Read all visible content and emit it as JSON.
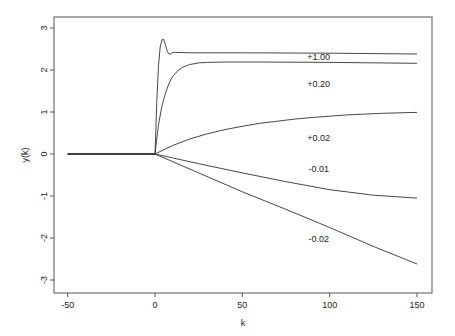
{
  "chart_data": {
    "type": "line",
    "title": "",
    "xlabel": "k",
    "ylabel": "y(k)",
    "xlim": [
      -55,
      160
    ],
    "ylim": [
      -3.2,
      3.3
    ],
    "xticks": [
      -50,
      0,
      50,
      100,
      150
    ],
    "yticks": [
      -3,
      -2,
      -1,
      0,
      1,
      2,
      3
    ],
    "grid": false,
    "legend": "none (inline labels)",
    "line_color": "#333333",
    "series": [
      {
        "name": "+1.00",
        "label_pos": [
          88,
          2.25
        ],
        "points": [
          [
            -50,
            0
          ],
          [
            0,
            0
          ],
          [
            1,
            1.2
          ],
          [
            2,
            2.1
          ],
          [
            3,
            2.55
          ],
          [
            4,
            2.72
          ],
          [
            5,
            2.73
          ],
          [
            6,
            2.6
          ],
          [
            7,
            2.45
          ],
          [
            8,
            2.38
          ],
          [
            9,
            2.38
          ],
          [
            10,
            2.42
          ],
          [
            11,
            2.42
          ],
          [
            20,
            2.41
          ],
          [
            50,
            2.41
          ],
          [
            100,
            2.4
          ],
          [
            150,
            2.38
          ]
        ]
      },
      {
        "name": "+0.20",
        "label_pos": [
          88,
          1.6
        ],
        "points": [
          [
            -50,
            0
          ],
          [
            0,
            0
          ],
          [
            2,
            0.7
          ],
          [
            4,
            1.15
          ],
          [
            6,
            1.45
          ],
          [
            8,
            1.68
          ],
          [
            10,
            1.84
          ],
          [
            13,
            1.98
          ],
          [
            16,
            2.07
          ],
          [
            20,
            2.13
          ],
          [
            25,
            2.17
          ],
          [
            30,
            2.18
          ],
          [
            40,
            2.19
          ],
          [
            60,
            2.19
          ],
          [
            100,
            2.18
          ],
          [
            150,
            2.16
          ]
        ]
      },
      {
        "name": "+0.02",
        "label_pos": [
          88,
          0.3
        ],
        "points": [
          [
            -50,
            0
          ],
          [
            0,
            0
          ],
          [
            10,
            0.2
          ],
          [
            20,
            0.36
          ],
          [
            30,
            0.48
          ],
          [
            40,
            0.58
          ],
          [
            50,
            0.66
          ],
          [
            60,
            0.73
          ],
          [
            70,
            0.78
          ],
          [
            80,
            0.83
          ],
          [
            90,
            0.87
          ],
          [
            100,
            0.9
          ],
          [
            110,
            0.93
          ],
          [
            120,
            0.95
          ],
          [
            130,
            0.97
          ],
          [
            140,
            0.98
          ],
          [
            150,
            0.99
          ]
        ]
      },
      {
        "name": "-0.01",
        "label_pos": [
          88,
          -0.42
        ],
        "points": [
          [
            -50,
            0
          ],
          [
            0,
            0
          ],
          [
            25,
            -0.23
          ],
          [
            50,
            -0.45
          ],
          [
            75,
            -0.66
          ],
          [
            100,
            -0.85
          ],
          [
            125,
            -0.98
          ],
          [
            150,
            -1.05
          ]
        ]
      },
      {
        "name": "-0.02",
        "label_pos": [
          88,
          -2.1
        ],
        "points": [
          [
            -50,
            0
          ],
          [
            0,
            0
          ],
          [
            25,
            -0.45
          ],
          [
            50,
            -0.9
          ],
          [
            75,
            -1.32
          ],
          [
            100,
            -1.75
          ],
          [
            125,
            -2.2
          ],
          [
            150,
            -2.62
          ]
        ]
      }
    ]
  }
}
